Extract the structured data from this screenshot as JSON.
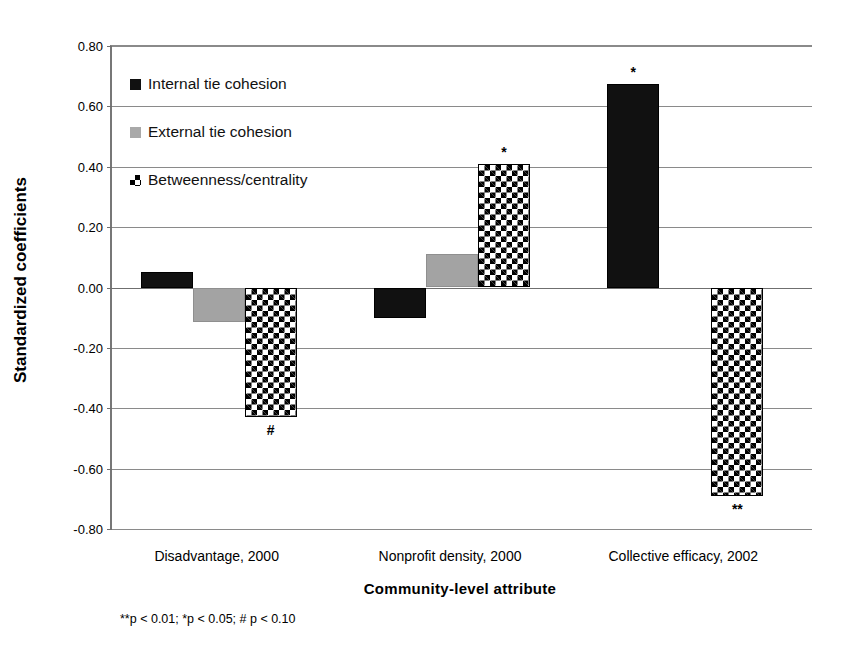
{
  "chart_data": {
    "type": "bar",
    "title": "",
    "xlabel": "Community-level attribute",
    "ylabel": "Standardized  coefficients",
    "categories": [
      "Disadvantage, 2000",
      "Nonprofit density, 2000",
      "Collective efficacy, 2002"
    ],
    "series": [
      {
        "name": "Internal tie cohesion",
        "color": "#111111",
        "pattern": "solid-black",
        "values": [
          0.05,
          -0.1,
          0.675
        ],
        "annotations": [
          "",
          "",
          "*"
        ]
      },
      {
        "name": "External tie cohesion",
        "color": "#a3a3a3",
        "pattern": "solid-gray",
        "values": [
          -0.115,
          0.11,
          0.0
        ],
        "annotations": [
          "",
          "",
          ""
        ]
      },
      {
        "name": "Betweenness/centrality",
        "color": "#000000",
        "pattern": "checkered",
        "values": [
          -0.43,
          0.41,
          -0.69
        ],
        "annotations": [
          "#",
          "*",
          "**"
        ]
      }
    ],
    "ylim": [
      -0.8,
      0.8
    ],
    "yticks": [
      "0.80",
      "0.60",
      "0.40",
      "0.20",
      "0.00",
      "-0.20",
      "-0.40",
      "-0.60",
      "-0.80"
    ],
    "ytick_values": [
      0.8,
      0.6,
      0.4,
      0.2,
      0.0,
      -0.2,
      -0.4,
      -0.6,
      -0.8
    ],
    "ytick_step": 0.2,
    "grid": true,
    "legend_position": "upper-left-inside",
    "footnote": "**p < 0.01; *p < 0.05;  # p < 0.10"
  },
  "axis": {
    "y_title": "Standardized  coefficients",
    "x_title": "Community-level attribute"
  },
  "legend": {
    "items": [
      {
        "label": "Internal tie cohesion",
        "swatch": "black-square-icon"
      },
      {
        "label": "External tie cohesion",
        "swatch": "gray-square-icon"
      },
      {
        "label": "Betweenness/centrality",
        "swatch": "checkered-square-icon"
      }
    ]
  },
  "footnote": {
    "text": "**p < 0.01; *p < 0.05;  # p < 0.10"
  },
  "colors": {
    "series_black": "#111111",
    "series_gray": "#a3a3a3",
    "checker_fg": "#000000",
    "checker_bg": "#ffffff",
    "gridline": "#8a8a8a",
    "axis": "#6f6f6f"
  }
}
